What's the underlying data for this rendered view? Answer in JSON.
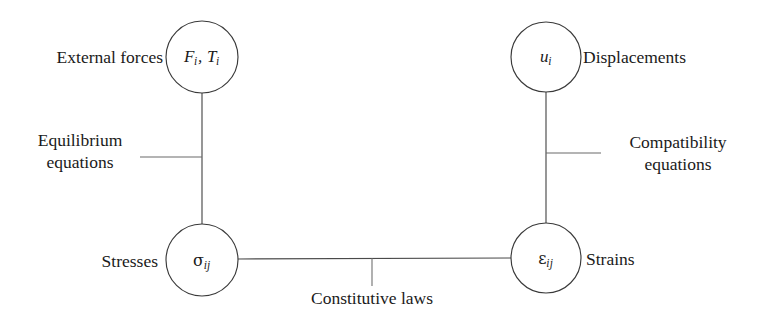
{
  "diagram": {
    "type": "tetrahedron-of-elasticity",
    "background_color": "#ffffff",
    "line_color": "#4a4a4a",
    "text_color": "#1a1a1a",
    "nodes": [
      {
        "id": "external-forces",
        "symbol_plain": "F_i, T_i",
        "label": "External forces",
        "label_side": "left",
        "cx": 202,
        "cy": 57,
        "r": 36
      },
      {
        "id": "displacements",
        "symbol_plain": "u_i",
        "label": "Displacements",
        "label_side": "right",
        "cx": 546,
        "cy": 57,
        "r": 35
      },
      {
        "id": "stresses",
        "symbol_plain": "sigma_ij",
        "label": "Stresses",
        "label_side": "left",
        "cx": 202,
        "cy": 260,
        "r": 36
      },
      {
        "id": "strains",
        "symbol_plain": "epsilon_ij",
        "label": "Strains",
        "label_side": "right",
        "cx": 546,
        "cy": 258,
        "r": 35
      }
    ],
    "edges": [
      {
        "id": "equilibrium",
        "label_line1": "Equilibrium",
        "label_line2": "equations",
        "from": "external-forces",
        "to": "stresses",
        "orientation": "vertical",
        "label_side": "left"
      },
      {
        "id": "compatibility",
        "label_line1": "Compatibility",
        "label_line2": "equations",
        "from": "displacements",
        "to": "strains",
        "orientation": "vertical",
        "label_side": "right"
      },
      {
        "id": "constitutive",
        "label_line1": "Constitutive laws",
        "label_line2": "",
        "from": "stresses",
        "to": "strains",
        "orientation": "horizontal",
        "label_side": "below"
      }
    ]
  }
}
